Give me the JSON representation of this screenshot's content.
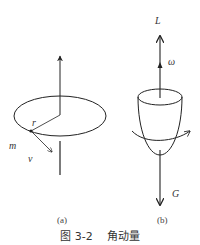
{
  "figure": {
    "caption": "图 3-2    角动量",
    "panels": [
      {
        "id": "a",
        "label": "(a)",
        "description": "Point mass m moving in a circle of radius r with velocity v; angular momentum along vertical axis",
        "annotations": {
          "radius": "r",
          "mass": "m",
          "velocity": "v"
        }
      },
      {
        "id": "b",
        "label": "(b)",
        "description": "Spinning top/cup with angular momentum L and angular velocity ω pointing upward, gravity G downward, rotation arrow around body",
        "annotations": {
          "angular_momentum": "L",
          "angular_velocity": "ω",
          "gravity": "G"
        }
      }
    ]
  },
  "colors": {
    "stroke": "#222222",
    "text": "#333333",
    "background": "#ffffff"
  }
}
